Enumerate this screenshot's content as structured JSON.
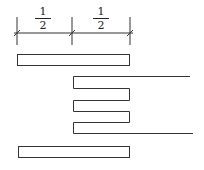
{
  "diagram": {
    "dimension_labels": [
      {
        "numerator": "1",
        "denominator": "2"
      },
      {
        "numerator": "1",
        "denominator": "2"
      }
    ],
    "stroke_color": "#333333",
    "dimension_line": {
      "y": 33,
      "ticks_x": [
        17,
        72,
        130
      ],
      "tick_top": 17,
      "tick_bottom": 45
    },
    "top_bar": {
      "x": 17,
      "y": 54,
      "w": 113,
      "h": 12
    },
    "bottom_bar": {
      "x": 18,
      "y": 146,
      "w": 112,
      "h": 12
    },
    "serpentine": {
      "left_x": 73,
      "right_x": 129,
      "rows_y": [
        76,
        89,
        101,
        112,
        123,
        134
      ],
      "top_tail_x": 190,
      "bottom_tail_x": 193
    }
  }
}
